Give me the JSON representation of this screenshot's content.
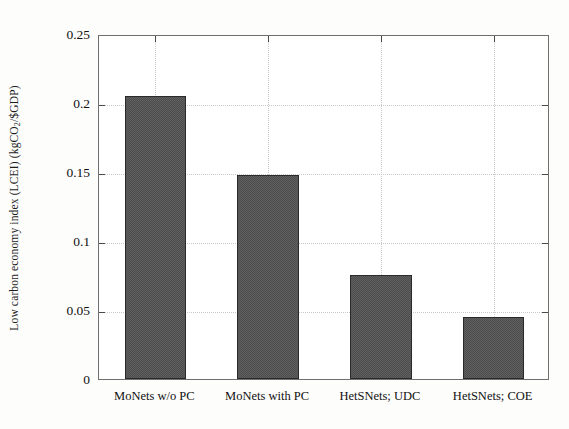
{
  "chart_data": {
    "type": "bar",
    "title": "",
    "subtitle": "",
    "xlabel": "",
    "ylabel": "Low carbon economy index (LCEI) (kgCO2/$GDP)",
    "ylabel_parts": {
      "prefix": "Low carbon economy index (LCEI) (kgCO",
      "subscript": "2",
      "suffix": "/$GDP)"
    },
    "categories": [
      "MoNets w/o PC",
      "MoNets with PC",
      "HetSNets; UDC",
      "HetSNets; COE"
    ],
    "values": [
      0.205,
      0.1475,
      0.0755,
      0.045
    ],
    "ylim": [
      0,
      0.25
    ],
    "yticks": [
      0,
      0.05,
      0.1,
      0.15,
      0.2,
      0.25
    ],
    "ytick_labels": [
      "0",
      "0.05",
      "0.1",
      "0.15",
      "0.2",
      "0.25"
    ],
    "grid": true,
    "legend": null,
    "bar_color": "#4d4d4d",
    "frame_color": "#6f6f6f",
    "grid_color": "#c9c9c9"
  }
}
